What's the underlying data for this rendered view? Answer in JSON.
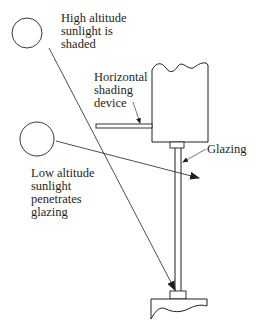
{
  "diagram": {
    "labels": {
      "high_sun": "High altitude\nsunlight is\nshaded",
      "shading_device": "Horizontal\nshading\ndevice",
      "glazing": "Glazing",
      "low_sun": "Low altitude\nsunlight\npenetrates\nglazing"
    },
    "colors": {
      "stroke": "#231f20",
      "background": "#ffffff"
    }
  }
}
